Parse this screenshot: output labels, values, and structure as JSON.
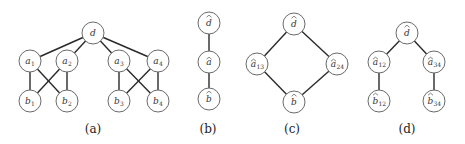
{
  "panels": [
    {
      "id": "a",
      "caption": "(a)",
      "caption_pos": [
        93,
        129
      ],
      "nodes": [
        {
          "id": "d",
          "base": "d",
          "sub": "",
          "hat": false,
          "x": 93,
          "y": 33
        },
        {
          "id": "a1",
          "base": "a",
          "sub": "1",
          "hat": false,
          "x": 30,
          "y": 61
        },
        {
          "id": "a2",
          "base": "a",
          "sub": "2",
          "hat": false,
          "x": 67,
          "y": 61
        },
        {
          "id": "a3",
          "base": "a",
          "sub": "3",
          "hat": false,
          "x": 119,
          "y": 61
        },
        {
          "id": "a4",
          "base": "a",
          "sub": "4",
          "hat": false,
          "x": 158,
          "y": 61
        },
        {
          "id": "b1",
          "base": "b",
          "sub": "1",
          "hat": false,
          "x": 30,
          "y": 101
        },
        {
          "id": "b2",
          "base": "b",
          "sub": "2",
          "hat": false,
          "x": 67,
          "y": 101
        },
        {
          "id": "b3",
          "base": "b",
          "sub": "3",
          "hat": false,
          "x": 119,
          "y": 101
        },
        {
          "id": "b4",
          "base": "b",
          "sub": "4",
          "hat": false,
          "x": 158,
          "y": 101
        }
      ],
      "edges": [
        [
          "d",
          "a1"
        ],
        [
          "d",
          "a2"
        ],
        [
          "d",
          "a3"
        ],
        [
          "d",
          "a4"
        ],
        [
          "a1",
          "b1"
        ],
        [
          "a1",
          "b2"
        ],
        [
          "a2",
          "b1"
        ],
        [
          "a2",
          "b2"
        ],
        [
          "a3",
          "b3"
        ],
        [
          "a3",
          "b4"
        ],
        [
          "a4",
          "b3"
        ],
        [
          "a4",
          "b4"
        ]
      ]
    },
    {
      "id": "b",
      "caption": "(b)",
      "caption_pos": [
        208,
        129
      ],
      "nodes": [
        {
          "id": "d",
          "base": "d",
          "sub": "",
          "hat": true,
          "x": 209,
          "y": 23
        },
        {
          "id": "a",
          "base": "a",
          "sub": "",
          "hat": true,
          "x": 209,
          "y": 62
        },
        {
          "id": "b",
          "base": "b",
          "sub": "",
          "hat": true,
          "x": 209,
          "y": 99
        }
      ],
      "edges": [
        [
          "d",
          "a"
        ],
        [
          "a",
          "b"
        ]
      ]
    },
    {
      "id": "c",
      "caption": "(c)",
      "caption_pos": [
        292,
        129
      ],
      "nodes": [
        {
          "id": "d",
          "base": "d",
          "sub": "",
          "hat": true,
          "x": 294,
          "y": 24
        },
        {
          "id": "a13",
          "base": "a",
          "sub": "13",
          "hat": true,
          "x": 257,
          "y": 64
        },
        {
          "id": "a24",
          "base": "a",
          "sub": "24",
          "hat": true,
          "x": 337,
          "y": 64
        },
        {
          "id": "b",
          "base": "b",
          "sub": "",
          "hat": true,
          "x": 294,
          "y": 102
        }
      ],
      "edges": [
        [
          "d",
          "a13"
        ],
        [
          "d",
          "a24"
        ],
        [
          "a13",
          "b"
        ],
        [
          "a24",
          "b"
        ]
      ]
    },
    {
      "id": "d",
      "caption": "(d)",
      "caption_pos": [
        407,
        129
      ],
      "nodes": [
        {
          "id": "d",
          "base": "d",
          "sub": "",
          "hat": true,
          "x": 407,
          "y": 33
        },
        {
          "id": "a12",
          "base": "a",
          "sub": "12",
          "hat": true,
          "x": 379,
          "y": 62
        },
        {
          "id": "a34",
          "base": "a",
          "sub": "34",
          "hat": true,
          "x": 434,
          "y": 62
        },
        {
          "id": "b12",
          "base": "b",
          "sub": "12",
          "hat": true,
          "x": 379,
          "y": 101
        },
        {
          "id": "b34",
          "base": "b",
          "sub": "34",
          "hat": true,
          "x": 434,
          "y": 101
        }
      ],
      "edges": [
        [
          "d",
          "a12"
        ],
        [
          "d",
          "a34"
        ],
        [
          "a12",
          "b12"
        ],
        [
          "a34",
          "b34"
        ]
      ]
    }
  ],
  "style": {
    "node_radius": 11,
    "edge_color": "#2a2a2a",
    "node_stroke": "#6a6a6a",
    "background": "#ffffff"
  }
}
